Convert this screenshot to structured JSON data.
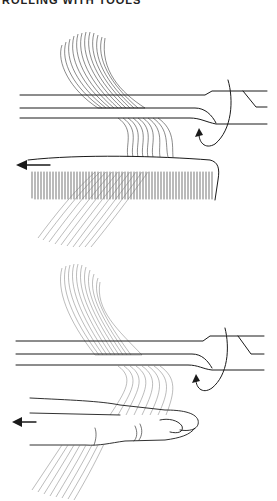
{
  "header": {
    "clipped_title": "ROLLING WITH TOOLS"
  },
  "figures": [
    {
      "id": "top",
      "caption": "Hair strand wrapped around curling iron, held taut with a comb",
      "elements": [
        "curling-iron",
        "hair-strand",
        "comb",
        "rotation-arrow",
        "pull-direction-arrow"
      ],
      "pull_direction": "left"
    },
    {
      "id": "bottom",
      "caption": "Hair strand wrapped around curling iron, held taut with fingers",
      "elements": [
        "curling-iron",
        "hair-strand",
        "fingers",
        "rotation-arrow",
        "pull-direction-arrow"
      ],
      "pull_direction": "left"
    }
  ],
  "colors": {
    "ink": "#1a1a1a",
    "background": "#ffffff"
  }
}
